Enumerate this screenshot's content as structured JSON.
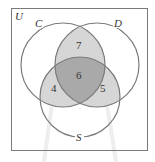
{
  "diagram": {
    "type": "venn-3",
    "universe_label": "U",
    "sets": [
      {
        "name": "C",
        "label": "C"
      },
      {
        "name": "D",
        "label": "D"
      },
      {
        "name": "S",
        "label": "S"
      }
    ],
    "regions": {
      "C_and_D_only": "7",
      "C_and_D_and_S": "6",
      "C_and_S_only": "4",
      "D_and_S_only": "5"
    },
    "colors": {
      "background": "#ffffff",
      "stroke": "#7a7a7a",
      "pairwise_fill": "#d6d6d6",
      "triple_fill": "#a9a9a9",
      "pointer": "#eeeeee"
    }
  }
}
